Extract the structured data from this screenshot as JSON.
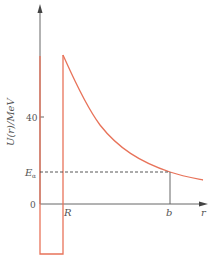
{
  "figure": {
    "type": "potential-energy-diagram",
    "y_axis_label": "U(r)/MeV",
    "x_axis_label": "r",
    "y_ticks": [
      {
        "label": "40",
        "value": 40
      },
      {
        "label": "0",
        "value": 0
      }
    ],
    "energy_level_label_main": "E",
    "energy_level_label_sub": "α",
    "x_markers": [
      {
        "label": "R",
        "description": "nuclear radius"
      },
      {
        "label": "b",
        "description": "classical turning point"
      }
    ],
    "colors": {
      "curve": "#e8735a",
      "axis": "#666666",
      "dashed": "#444444",
      "text": "#555555"
    }
  }
}
